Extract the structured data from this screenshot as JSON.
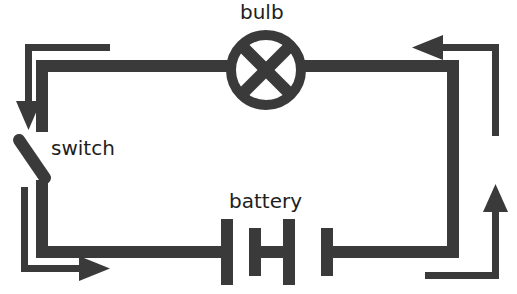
{
  "diagram": {
    "type": "electrical-circuit-schematic",
    "background_color": "#ffffff",
    "stroke_color": "#3a3a3a",
    "label_color": "#1e1e1e",
    "labels": {
      "bulb": "bulb",
      "switch": "switch",
      "battery": "battery"
    },
    "components": [
      {
        "name": "bulb",
        "symbol": "circle-with-x",
        "label": "bulb",
        "position": "top-center"
      },
      {
        "name": "switch",
        "symbol": "open-lever",
        "label": "switch",
        "position": "left-side",
        "state": "open"
      },
      {
        "name": "battery",
        "symbol": "multi-cell-plates",
        "label": "battery",
        "position": "bottom-center",
        "cells": 3
      }
    ],
    "current_arrows": [
      {
        "name": "arrow-top-left",
        "direction": "down",
        "glyph": "down-arrow"
      },
      {
        "name": "arrow-top-right",
        "direction": "left",
        "glyph": "left-arrow"
      },
      {
        "name": "arrow-bottom-left",
        "direction": "right",
        "glyph": "right-arrow"
      },
      {
        "name": "arrow-bottom-right",
        "direction": "up",
        "glyph": "up-arrow"
      }
    ]
  }
}
